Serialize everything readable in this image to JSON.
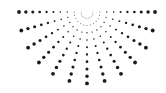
{
  "graphic": {
    "name": "radial-half-sun-dot-pattern",
    "center": [
      87,
      12
    ],
    "ray_count": 13,
    "angle_start_deg": 0,
    "angle_end_deg": 180,
    "dots_per_ray": 10,
    "inner_radius": 6,
    "outer_radius": 68,
    "vertical_scale": 1.05,
    "min_dot_radius": 0.35,
    "max_dot_radius": 1.9,
    "dot_color": "#1a1a1a",
    "background_color": "#ffffff"
  }
}
